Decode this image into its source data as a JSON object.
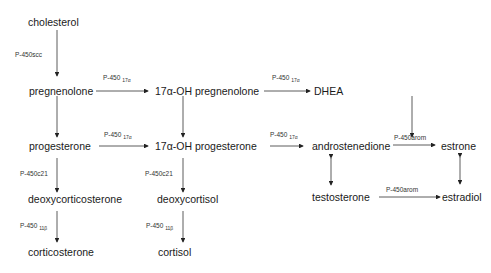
{
  "nodes": {
    "cholesterol": "cholesterol",
    "pregnenolone": "pregnenolone",
    "oh_pregnenolone": "17α-OH pregnenolone",
    "dhea": "DHEA",
    "progesterone": "progesterone",
    "oh_progesterone": "17α-OH progesterone",
    "androstenedione": "androstenedione",
    "estrone": "estrone",
    "deoxycorticosterone": "deoxycorticosterone",
    "deoxycortisol": "deoxycortisol",
    "testosterone": "testosterone",
    "estradiol": "estradiol",
    "corticosterone": "corticosterone",
    "cortisol": "cortisol"
  },
  "enzymes": {
    "scc": "P-450scc",
    "p450": "P-450",
    "sub17a": "17α",
    "sub11b": "11β",
    "c21": "P-450c21",
    "arom": "P-450arom"
  }
}
